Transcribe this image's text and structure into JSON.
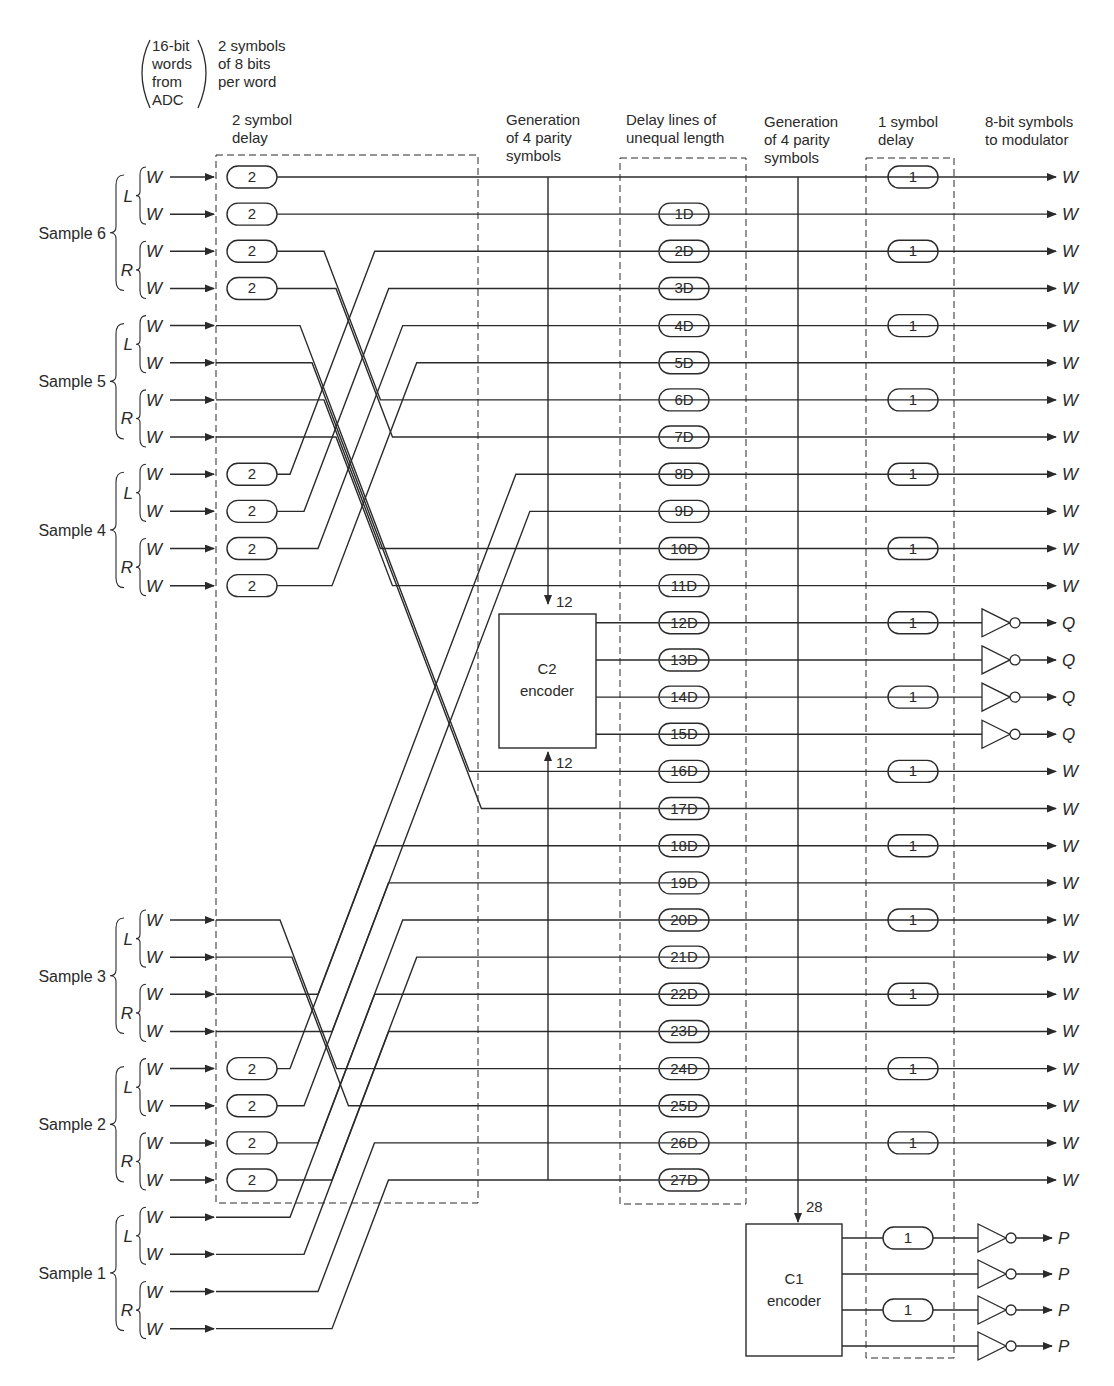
{
  "header": {
    "input_paren": [
      "16-bit",
      "words",
      "from",
      "ADC"
    ],
    "input_note": [
      "2 symbols",
      "of 8 bits",
      "per word"
    ],
    "col_2sym": [
      "2 symbol",
      "delay"
    ],
    "col_gen1": [
      "Generation",
      "of 4 parity",
      "symbols"
    ],
    "col_delay": [
      "Delay lines of",
      "unequal length"
    ],
    "col_gen2": [
      "Generation",
      "of 4 parity",
      "symbols"
    ],
    "col_1sym": [
      "1 symbol",
      "delay"
    ],
    "col_out": [
      "8-bit symbols",
      "to modulator"
    ]
  },
  "samples": [
    {
      "label": "Sample 6",
      "rows": [
        0,
        1,
        2,
        3
      ],
      "delayed": true
    },
    {
      "label": "Sample 5",
      "rows": [
        4,
        5,
        6,
        7
      ],
      "delayed": false
    },
    {
      "label": "Sample 4",
      "rows": [
        8,
        9,
        10,
        11
      ],
      "delayed": true
    },
    {
      "label": "Sample 3",
      "rows": [
        20,
        21,
        22,
        23
      ],
      "delayed": false
    },
    {
      "label": "Sample 2",
      "rows": [
        24,
        25,
        26,
        27
      ],
      "delayed": true
    },
    {
      "label": "Sample 1",
      "rows": [
        28,
        29,
        30,
        31
      ],
      "delayed": false
    }
  ],
  "channel_labels": {
    "left": "L",
    "right": "R",
    "word": "W"
  },
  "delay2_label": "2",
  "delay1_label": "1",
  "delay_lines": [
    "",
    "1D",
    "2D",
    "3D",
    "4D",
    "5D",
    "6D",
    "7D",
    "8D",
    "9D",
    "10D",
    "11D",
    "12D",
    "13D",
    "14D",
    "15D",
    "16D",
    "17D",
    "18D",
    "19D",
    "20D",
    "21D",
    "22D",
    "23D",
    "24D",
    "25D",
    "26D",
    "27D"
  ],
  "outputs": [
    "W",
    "W",
    "W",
    "W",
    "W",
    "W",
    "W",
    "W",
    "W",
    "W",
    "W",
    "W",
    "Q",
    "Q",
    "Q",
    "Q",
    "W",
    "W",
    "W",
    "W",
    "W",
    "W",
    "W",
    "W",
    "W",
    "W",
    "W",
    "W"
  ],
  "one_symbol_delay_rows": [
    0,
    2,
    4,
    6,
    8,
    10,
    12,
    14,
    16,
    18,
    20,
    22,
    24,
    26
  ],
  "routing": [
    [
      0,
      0
    ],
    [
      1,
      1
    ],
    [
      2,
      6
    ],
    [
      3,
      7
    ],
    [
      4,
      16
    ],
    [
      5,
      17
    ],
    [
      6,
      10
    ],
    [
      7,
      11
    ],
    [
      8,
      2
    ],
    [
      9,
      3
    ],
    [
      10,
      4
    ],
    [
      11,
      5
    ],
    [
      20,
      24
    ],
    [
      21,
      25
    ],
    [
      22,
      18
    ],
    [
      23,
      19
    ],
    [
      24,
      8
    ],
    [
      25,
      9
    ],
    [
      26,
      20
    ],
    [
      27,
      21
    ],
    [
      28,
      22
    ],
    [
      29,
      23
    ],
    [
      30,
      26
    ],
    [
      31,
      27
    ]
  ],
  "c2_encoder": {
    "title": "C2",
    "subtitle": "encoder",
    "in_top": "12",
    "in_bottom": "12"
  },
  "c1_encoder": {
    "title": "C1",
    "subtitle": "encoder",
    "in_top": "28"
  },
  "parity_p": [
    "P",
    "P",
    "P",
    "P"
  ],
  "colors": {
    "ink": "#2a2a2a",
    "background": "#ffffff"
  }
}
